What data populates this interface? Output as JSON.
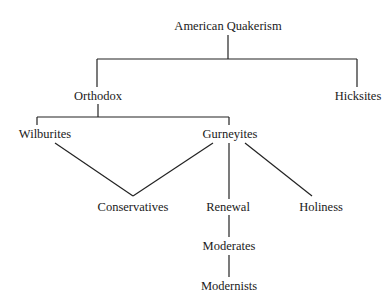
{
  "diagram": {
    "type": "tree",
    "nodes": {
      "root": "American Quakerism",
      "orthodox": "Orthodox",
      "hicksites": "Hicksites",
      "wilburites": "Wilburites",
      "gurneyites": "Gurneyites",
      "conservatives": "Conservatives",
      "renewal": "Renewal",
      "holiness": "Holiness",
      "moderates": "Moderates",
      "modernists": "Modernists"
    },
    "edges": [
      [
        "root",
        "orthodox"
      ],
      [
        "root",
        "hicksites"
      ],
      [
        "orthodox",
        "wilburites"
      ],
      [
        "orthodox",
        "gurneyites"
      ],
      [
        "wilburites",
        "conservatives"
      ],
      [
        "gurneyites",
        "conservatives"
      ],
      [
        "gurneyites",
        "renewal"
      ],
      [
        "gurneyites",
        "holiness"
      ],
      [
        "renewal",
        "moderates"
      ],
      [
        "moderates",
        "modernists"
      ]
    ]
  }
}
